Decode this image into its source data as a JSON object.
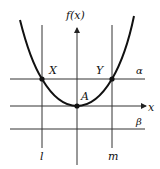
{
  "diagram": {
    "axes": {
      "y_label": "f(x)",
      "x_label": "x"
    },
    "points": {
      "X": {
        "label": "X"
      },
      "Y": {
        "label": "Y"
      },
      "A": {
        "label": "A"
      }
    },
    "horizontal_lines": {
      "alpha": {
        "label": "α"
      },
      "beta": {
        "label": "β"
      }
    },
    "vertical_lines": {
      "l": {
        "label": "l"
      },
      "m": {
        "label": "m"
      }
    },
    "colors": {
      "curve": "#111111",
      "lines": "#333333",
      "background": "#ffffff"
    }
  }
}
